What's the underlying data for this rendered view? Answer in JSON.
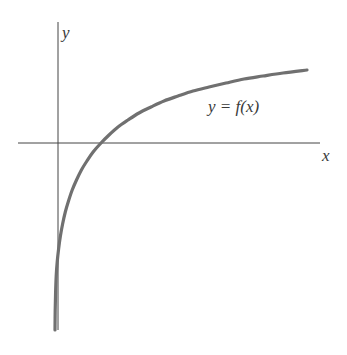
{
  "figure": {
    "background_color": "#ffffff",
    "width": 347,
    "height": 355
  },
  "axes": {
    "x_label": "x",
    "y_label": "y",
    "color": "#444444",
    "line_width": 1,
    "origin": {
      "x": 58,
      "y": 143
    },
    "x_axis_start": {
      "x": 18,
      "y": 143
    },
    "x_axis_end": {
      "x": 320,
      "y": 143
    },
    "y_axis_start": {
      "x": 58,
      "y": 22
    },
    "y_axis_end": {
      "x": 58,
      "y": 330
    }
  },
  "curve": {
    "label": "y = f(x)",
    "label_parts": {
      "y": "y",
      "equals": "=",
      "f": "f",
      "open_paren": "(",
      "x": "x",
      "close_paren": ")"
    },
    "color": "#707070",
    "line_width": 3.2,
    "shape": "logarithmic",
    "vertical_asymptote_x": 55,
    "x_intercept": {
      "x": 101,
      "y": 143
    },
    "right_end": {
      "x": 307,
      "y": 70
    },
    "bottom_end": {
      "x": 55,
      "y": 330
    }
  },
  "chart_data": {
    "type": "line",
    "title": "",
    "xlabel": "x",
    "ylabel": "y",
    "grid": false,
    "legend": "none",
    "annotations": [
      {
        "text": "y = f(x)",
        "x": 208,
        "y": 98
      }
    ],
    "series": [
      {
        "name": "y = f(x)",
        "color": "#707070",
        "description": "Increasing concave-down logarithmic curve with a vertical asymptote just left of the y-axis; crosses the x-axis to the right of the origin.",
        "points_px": [
          [
            55,
            330
          ],
          [
            55.2,
            310
          ],
          [
            55.6,
            292
          ],
          [
            56.2,
            276
          ],
          [
            57.2,
            262
          ],
          [
            58.6,
            249
          ],
          [
            60.4,
            236
          ],
          [
            62.6,
            224
          ],
          [
            65.3,
            212
          ],
          [
            68.5,
            201
          ],
          [
            72.2,
            190
          ],
          [
            76.5,
            180
          ],
          [
            81.4,
            170
          ],
          [
            86.9,
            161
          ],
          [
            93.1,
            152
          ],
          [
            101.0,
            143
          ],
          [
            109.0,
            135
          ],
          [
            118.0,
            127
          ],
          [
            128.0,
            120
          ],
          [
            139.0,
            113
          ],
          [
            151.0,
            107
          ],
          [
            164.0,
            101
          ],
          [
            178.0,
            96
          ],
          [
            193.0,
            91
          ],
          [
            209.0,
            87
          ],
          [
            226.0,
            83
          ],
          [
            244.0,
            79
          ],
          [
            263.0,
            76
          ],
          [
            283.0,
            73
          ],
          [
            307.0,
            70
          ]
        ],
        "x_range_px": [
          55,
          307
        ],
        "y_range_px": [
          70,
          330
        ]
      }
    ]
  }
}
